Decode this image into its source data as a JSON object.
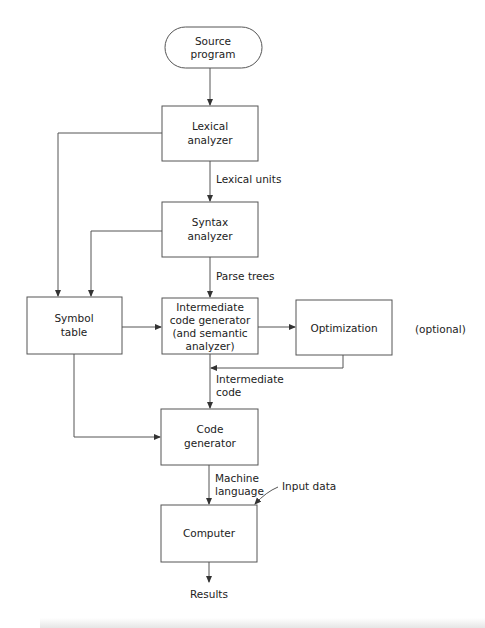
{
  "diagram": {
    "type": "flowchart",
    "colors": {
      "stroke": "#555555",
      "text": "#222222",
      "background": "#ffffff"
    },
    "nodes": {
      "source": {
        "shape": "terminator",
        "lines": [
          "Source",
          "program"
        ]
      },
      "lexical": {
        "shape": "rect",
        "lines": [
          "Lexical",
          "analyzer"
        ]
      },
      "syntax": {
        "shape": "rect",
        "lines": [
          "Syntax",
          "analyzer"
        ]
      },
      "symbol": {
        "shape": "rect",
        "lines": [
          "Symbol",
          "table"
        ]
      },
      "intermediate": {
        "shape": "rect",
        "lines": [
          "Intermediate",
          "code generator",
          "(and semantic",
          "analyzer)"
        ]
      },
      "optimization": {
        "shape": "rect",
        "lines": [
          "Optimization"
        ]
      },
      "codegen": {
        "shape": "rect",
        "lines": [
          "Code",
          "generator"
        ]
      },
      "computer": {
        "shape": "rect",
        "lines": [
          "Computer"
        ]
      }
    },
    "edge_labels": {
      "lexical_units": "Lexical units",
      "parse_trees": "Parse trees",
      "intermediate_code": [
        "Intermediate",
        "code"
      ],
      "machine_language": [
        "Machine",
        "language"
      ],
      "input_data": "Input data",
      "results": "Results"
    },
    "annotations": {
      "optional": "(optional)"
    },
    "edges": [
      {
        "from": "source",
        "to": "lexical"
      },
      {
        "from": "lexical",
        "to": "syntax",
        "label": "Lexical units"
      },
      {
        "from": "lexical",
        "to": "symbol"
      },
      {
        "from": "syntax",
        "to": "intermediate",
        "label": "Parse trees"
      },
      {
        "from": "syntax",
        "to": "symbol"
      },
      {
        "from": "symbol",
        "to": "intermediate"
      },
      {
        "from": "symbol",
        "to": "codegen"
      },
      {
        "from": "intermediate",
        "to": "optimization"
      },
      {
        "from": "optimization",
        "to": "intermediate-code-path"
      },
      {
        "from": "intermediate",
        "to": "codegen",
        "label": "Intermediate code"
      },
      {
        "from": "codegen",
        "to": "computer",
        "label": "Machine language"
      },
      {
        "from": "input-data",
        "to": "computer",
        "label": "Input data"
      },
      {
        "from": "computer",
        "to": "results",
        "label": "Results"
      }
    ]
  }
}
